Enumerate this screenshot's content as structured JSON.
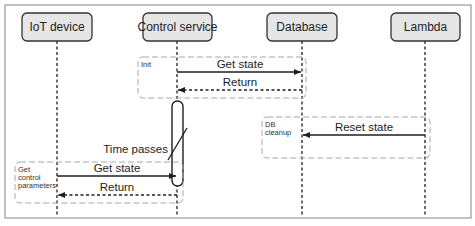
{
  "diagram": {
    "type": "sequence",
    "participants": [
      {
        "id": "iot",
        "label": "IoT device"
      },
      {
        "id": "control",
        "label": "Control service"
      },
      {
        "id": "db",
        "label": "Database"
      },
      {
        "id": "lambda",
        "label": "Lambda"
      }
    ],
    "groups": [
      {
        "id": "init",
        "label_lines": [
          "Init"
        ]
      },
      {
        "id": "dbcleanup",
        "label_lines": [
          "DB",
          "cleanup"
        ]
      },
      {
        "id": "getparams",
        "label_lines": [
          "Get",
          "control",
          "parameters"
        ]
      }
    ],
    "messages": [
      {
        "group": "init",
        "from": "control",
        "to": "db",
        "label": "Get state",
        "style": "solid"
      },
      {
        "group": "init",
        "from": "db",
        "to": "control",
        "label": "Return",
        "style": "dashed"
      },
      {
        "group": "dbcleanup",
        "from": "lambda",
        "to": "db",
        "label": "Reset state",
        "style": "solid"
      },
      {
        "group": "getparams",
        "from": "iot",
        "to": "control",
        "label": "Get state",
        "style": "solid"
      },
      {
        "group": "getparams",
        "from": "control",
        "to": "iot",
        "label": "Return",
        "style": "dashed"
      }
    ],
    "time_break": {
      "participant": "control",
      "label": "Time passes"
    },
    "colors": {
      "participant_fill": "#e6e6e6",
      "participant_stroke": "#333333",
      "line": "#1e1e1e",
      "group_stroke": "#a0a0a0",
      "frame_stroke": "#9a9a9a"
    }
  }
}
